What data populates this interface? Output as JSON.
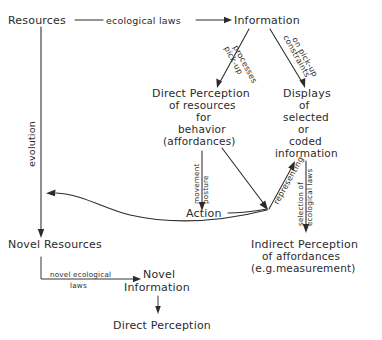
{
  "diagram": {
    "background_color": "#ffffff",
    "ink_color": "#2b2b2b",
    "nodes": {
      "resources": "Resources",
      "information": "Information",
      "direct_perception_1": "Direct Perception",
      "direct_perception_2": "of resources",
      "direct_perception_3": "for",
      "direct_perception_4": "behavior",
      "direct_perception_5": "(affordances)",
      "displays_1": "Displays",
      "displays_2": "of",
      "displays_3": "selected",
      "displays_4": "or",
      "displays_5": "coded",
      "displays_6": "information",
      "action": "Action",
      "novel_resources": "Novel Resources",
      "novel_information_1": "Novel",
      "novel_information_2": "Information",
      "indirect_perception_1": "Indirect Perception",
      "indirect_perception_2": "of affordances",
      "indirect_perception_3": "(e.g.measurement)",
      "direct_perception_bottom": "Direct Perception"
    },
    "edge_labels": {
      "ecological_laws": "ecological laws",
      "pickup_processes_1": "pick-up",
      "pickup_processes_2": "processes",
      "constraints_1": "constraints",
      "constraints_2": "on pick-up",
      "evolution": "evolution",
      "movement_1": "movement",
      "movement_2": "posture",
      "representing": "representing",
      "selection_1": "selection of",
      "selection_2": "ecological laws",
      "novel_ecological_1": "novel ecological",
      "novel_ecological_2": "laws"
    }
  }
}
